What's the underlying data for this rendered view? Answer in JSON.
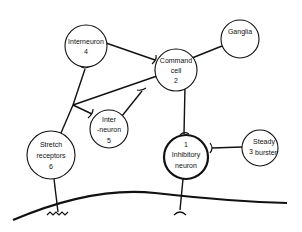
{
  "diagram": {
    "type": "neural-circuit",
    "nodes": [
      {
        "id": "n4",
        "lines": [
          "Interneuron",
          "4"
        ]
      },
      {
        "id": "n2",
        "lines": [
          "Command",
          "cell",
          "2"
        ]
      },
      {
        "id": "ganglia",
        "lines": [
          "Ganglia"
        ]
      },
      {
        "id": "n6",
        "lines": [
          "Stretch",
          "receptors",
          "6"
        ]
      },
      {
        "id": "n5",
        "lines": [
          "Inter",
          "-neuron",
          "5"
        ]
      },
      {
        "id": "n1",
        "lines": [
          "1",
          "Inhibitory",
          "neuron"
        ]
      },
      {
        "id": "n3",
        "lines": [
          "Steady",
          "3",
          "burster"
        ]
      }
    ],
    "edges": [
      {
        "from": "n4",
        "to": "n2",
        "type": "synapse"
      },
      {
        "from": "ganglia",
        "to": "n2",
        "type": "synapse"
      },
      {
        "from": "n6",
        "to": "n4",
        "type": "synapse"
      },
      {
        "from": "n6",
        "to": "n2",
        "type": "synapse"
      },
      {
        "from": "n6",
        "to": "n5",
        "type": "synapse"
      },
      {
        "from": "n5",
        "to": "n2",
        "type": "synapse"
      },
      {
        "from": "n2",
        "to": "n1",
        "type": "synapse"
      },
      {
        "from": "n3",
        "to": "n1",
        "type": "synapse"
      },
      {
        "from": "n1",
        "to": "muscle",
        "type": "synapse"
      },
      {
        "from": "n6",
        "to": "muscle",
        "type": "sensory-ending"
      }
    ]
  }
}
